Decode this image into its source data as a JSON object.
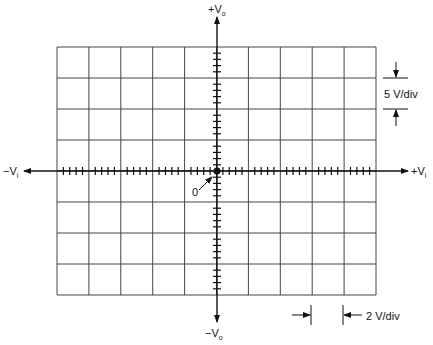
{
  "labels": {
    "top": "+V",
    "top_sub": "o",
    "bottom": "−V",
    "bottom_sub": "o",
    "left": "−V",
    "left_sub": "i",
    "right": "+V",
    "right_sub": "i",
    "origin": "0",
    "vertical_scale": "5 V/div",
    "horizontal_scale": "2 V/div"
  },
  "graticule": {
    "columns": 10,
    "rows": 8,
    "minor_ticks_per_div": 5,
    "line_color": "#444444"
  }
}
